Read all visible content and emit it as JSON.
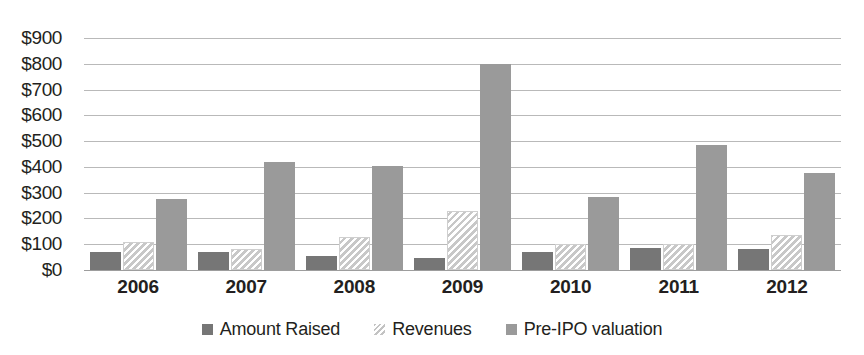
{
  "chart_data": {
    "type": "bar",
    "title": "",
    "xlabel": "",
    "ylabel": "",
    "ylim": [
      0,
      900
    ],
    "ytick_step": 100,
    "ytick_prefix": "$",
    "grid": true,
    "grid_axis": "y",
    "legend_position": "bottom",
    "categories": [
      "2006",
      "2007",
      "2008",
      "2009",
      "2010",
      "2011",
      "2012"
    ],
    "ytick_labels": [
      "$900",
      "$800",
      "$700",
      "$600",
      "$500",
      "$400",
      "$300",
      "$200",
      "$100",
      "$0"
    ],
    "ytick_values": [
      900,
      800,
      700,
      600,
      500,
      400,
      300,
      200,
      100,
      0
    ],
    "series": [
      {
        "name": "Amount Raised",
        "style": "solid-dark-gray",
        "color": "#767676",
        "values": [
          70,
          70,
          55,
          45,
          70,
          85,
          80
        ]
      },
      {
        "name": "Revenues",
        "style": "diagonal-hatch",
        "color": "#c8c8c8",
        "values": [
          110,
          80,
          130,
          230,
          100,
          100,
          135
        ]
      },
      {
        "name": "Pre-IPO valuation",
        "style": "solid-medium-gray",
        "color": "#9a9a9a",
        "values": [
          275,
          420,
          405,
          800,
          285,
          485,
          375
        ]
      }
    ]
  },
  "colors": {
    "amount_raised": "#767676",
    "revenues": "#c8c8c8",
    "pre_ipo": "#9a9a9a",
    "gridline": "#b9b9b9",
    "baseline": "#9d9d9d",
    "text": "#231f20",
    "background": "#ffffff"
  }
}
